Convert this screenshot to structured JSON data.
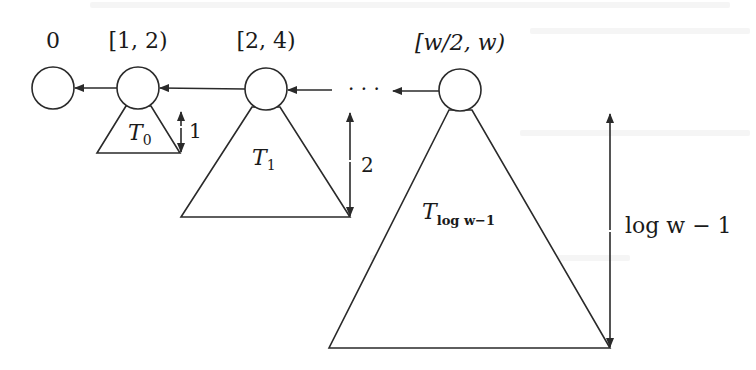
{
  "diagram": {
    "nodes": [
      {
        "id": "n0",
        "label": "0",
        "cx": 53,
        "cy": 88
      },
      {
        "id": "n1",
        "label": "[1, 2)",
        "cx": 138,
        "cy": 88
      },
      {
        "id": "n2",
        "label": "[2, 4)",
        "cx": 266,
        "cy": 89
      },
      {
        "id": "n3",
        "label": "[w/2, w)",
        "cx": 460,
        "cy": 90
      }
    ],
    "ellipsis": "· · ·",
    "trees": [
      {
        "id": "T0",
        "name": "T",
        "subscript": "0",
        "height_label": "1"
      },
      {
        "id": "T1",
        "name": "T",
        "subscript": "1",
        "height_label": "2"
      },
      {
        "id": "Tlog",
        "name": "T",
        "subscript": "log w−1",
        "height_label": "log w − 1"
      }
    ],
    "edge_direction": "right-to-left",
    "colors": {
      "stroke": "#2a2a2a",
      "background": "#ffffff",
      "text": "#1a1a1a"
    }
  }
}
